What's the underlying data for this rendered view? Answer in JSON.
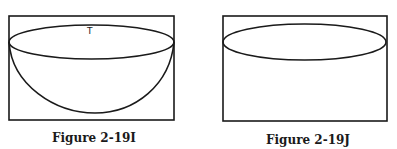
{
  "figures": [
    {
      "id": "2-19I",
      "caption": "Figure 2-19I",
      "label": "T",
      "shape": "ellipse with hemispherical bowl inside rectangle"
    },
    {
      "id": "2-19J",
      "caption": "Figure 2-19J",
      "shape": "ellipse inside rectangle"
    }
  ],
  "colors": {
    "stroke": "#1a1a1a",
    "background": "#ffffff"
  }
}
